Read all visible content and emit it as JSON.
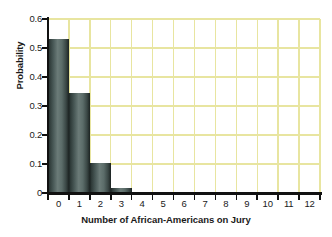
{
  "chart_data": {
    "type": "bar",
    "title": "",
    "xlabel": "Number of African-Americans on Jury",
    "ylabel": "Probability",
    "categories": [
      "0",
      "1",
      "2",
      "3",
      "4",
      "5",
      "6",
      "7",
      "8",
      "9",
      "10",
      "11",
      "12"
    ],
    "values": [
      0.53,
      0.345,
      0.105,
      0.018,
      0.002,
      0.0,
      0.0,
      0.0,
      0.0,
      0.0,
      0.0,
      0.0,
      0.0
    ],
    "xlim": [
      0,
      13
    ],
    "ylim": [
      0,
      0.6
    ],
    "ytick_labels": [
      "0.6",
      "0.5",
      "0.4",
      "0.3",
      "0.2",
      "0.1",
      "0"
    ],
    "ytick_values": [
      0.6,
      0.5,
      0.4,
      0.3,
      0.2,
      0.1,
      0
    ],
    "xtick_labels": [
      "0",
      "1",
      "2",
      "3",
      "4",
      "5",
      "6",
      "7",
      "8",
      "9",
      "10",
      "11",
      "12"
    ],
    "grid": "both",
    "legend": "none",
    "colors": {
      "grid": "#e8e5a0",
      "axis": "#111111",
      "bar_dark": "#1d2524",
      "bar_light": "#6b7b78",
      "background": "#ffffff",
      "text": "#1a1a1a"
    }
  }
}
